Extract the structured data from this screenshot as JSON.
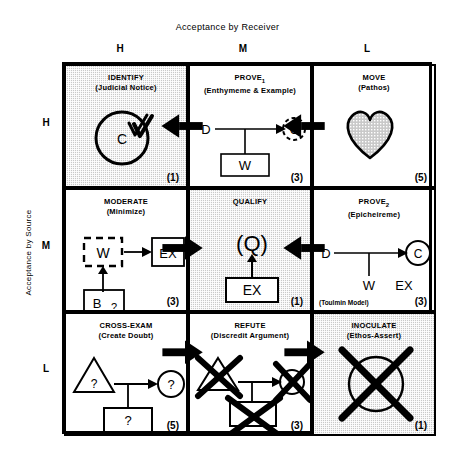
{
  "axes": {
    "top_title": "Acceptance by Receiver",
    "left_title": "Acceptance by Source",
    "columns": [
      "H",
      "M",
      "L"
    ],
    "rows": [
      "H",
      "M",
      "L"
    ]
  },
  "colors": {
    "line": "#000000",
    "shade": "#c9c9c9",
    "background": "#ffffff"
  },
  "cells": [
    {
      "id": "identify",
      "row": "H",
      "col": "H",
      "title": "IDENTIFY",
      "subtitle": "(Judicial Notice)",
      "number": "(1)",
      "shaded": true,
      "note": "",
      "figure_labels": [
        "C"
      ],
      "figure": "circle-with-check"
    },
    {
      "id": "prove1",
      "row": "H",
      "col": "M",
      "title": "PROVE",
      "title_sub": "1",
      "subtitle": "(Enthymeme & Example)",
      "number": "(3)",
      "shaded": false,
      "note": "",
      "figure_labels": [
        "D",
        "C",
        "W"
      ],
      "figure": "d-to-dashed-c-with-w"
    },
    {
      "id": "move",
      "row": "H",
      "col": "L",
      "title": "MOVE",
      "subtitle": "(Pathos)",
      "number": "(5)",
      "shaded": false,
      "note": "",
      "figure_labels": [],
      "figure": "heart"
    },
    {
      "id": "moderate",
      "row": "M",
      "col": "H",
      "title": "MODERATE",
      "subtitle": "(Minimize)",
      "number": "(3)",
      "shaded": false,
      "note": "",
      "figure_labels": [
        "W",
        "EX",
        "B",
        "?"
      ],
      "figure": "dashed-w-to-ex-with-b"
    },
    {
      "id": "qualify",
      "row": "M",
      "col": "M",
      "title": "QUALIFY",
      "subtitle": "",
      "number": "(1)",
      "shaded": true,
      "note": "",
      "figure_labels": [
        "(Q)",
        "EX"
      ],
      "figure": "q-over-ex"
    },
    {
      "id": "prove2",
      "row": "M",
      "col": "L",
      "title": "PROVE",
      "title_sub": "2",
      "subtitle": "(Epicheireme)",
      "number": "(3)",
      "shaded": false,
      "note": "(Toulmin Model)",
      "figure_labels": [
        "D",
        "C",
        "W",
        "EX"
      ],
      "figure": "d-to-c-with-w-ex"
    },
    {
      "id": "cross-exam",
      "row": "L",
      "col": "H",
      "title": "CROSS-EXAM",
      "subtitle": "(Create Doubt)",
      "number": "(5)",
      "shaded": false,
      "note": "",
      "figure_labels": [
        "?",
        "?",
        "?"
      ],
      "figure": "question-triangle-circle-box"
    },
    {
      "id": "refute",
      "row": "L",
      "col": "M",
      "title": "REFUTE",
      "subtitle": "(Discredit Argument)",
      "number": "(3)",
      "shaded": false,
      "note": "",
      "figure_labels": [],
      "figure": "crossed-out-triangle-circle-box"
    },
    {
      "id": "inoculate",
      "row": "L",
      "col": "L",
      "title": "INOCULATE",
      "subtitle": "(Ethos-Assert)",
      "number": "(1)",
      "shaded": true,
      "note": "",
      "figure_labels": [],
      "figure": "crossed-out-circle"
    }
  ],
  "connector_arrows": [
    {
      "id": "top-left-arrow",
      "between": [
        "prove1",
        "identify"
      ],
      "direction": "left"
    },
    {
      "id": "top-right-arrow",
      "between": [
        "move",
        "prove1"
      ],
      "direction": "left"
    },
    {
      "id": "mid-left-arrow",
      "between": [
        "moderate",
        "qualify"
      ],
      "direction": "right"
    },
    {
      "id": "mid-right-arrow",
      "between": [
        "prove2",
        "qualify"
      ],
      "direction": "left"
    },
    {
      "id": "bot-left-arrow",
      "between": [
        "cross-exam",
        "refute"
      ],
      "direction": "right"
    },
    {
      "id": "bot-right-arrow",
      "between": [
        "refute",
        "inoculate"
      ],
      "direction": "right"
    }
  ]
}
